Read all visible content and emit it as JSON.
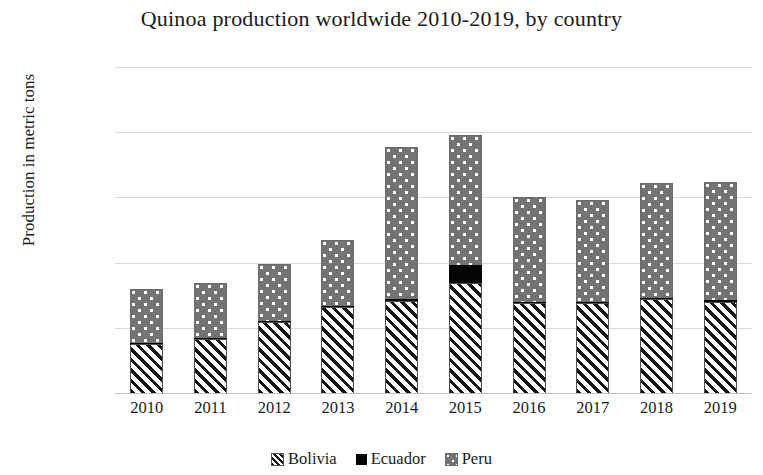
{
  "chart_data": {
    "type": "bar",
    "stacked": true,
    "title": "Quinoa production worldwide 2010-2019, by country",
    "xlabel": "",
    "ylabel": "Production in metric tons",
    "categories": [
      "2010",
      "2011",
      "2012",
      "2013",
      "2014",
      "2015",
      "2016",
      "2017",
      "2018",
      "2019"
    ],
    "ylim": [
      0,
      250000
    ],
    "yticks": [
      0,
      50000,
      100000,
      150000,
      200000,
      250000
    ],
    "ytick_labels": [
      "0",
      "50000",
      "100000",
      "150000",
      "200000",
      "250000"
    ],
    "grid": true,
    "legend_position": "bottom",
    "series": [
      {
        "name": "Bolivia",
        "pattern": "diagonal-hatch",
        "color": "#ffffff",
        "values": [
          37600,
          41400,
          54500,
          66000,
          70500,
          84400,
          69000,
          69000,
          72000,
          70000
        ]
      },
      {
        "name": "Ecuador",
        "pattern": "solid",
        "color": "#050505",
        "values": [
          800,
          900,
          900,
          1000,
          1500,
          13800,
          1000,
          900,
          900,
          1000
        ]
      },
      {
        "name": "Peru",
        "pattern": "dotted",
        "color": "#737373",
        "values": [
          41200,
          42100,
          43600,
          50400,
          117000,
          99600,
          80000,
          78100,
          88100,
          91000
        ]
      }
    ],
    "totals": [
      79600,
      84400,
      99000,
      117400,
      189000,
      197800,
      150000,
      148000,
      161000,
      162000
    ]
  },
  "legend": {
    "items": [
      {
        "label": "Bolivia",
        "swatch": "hatch-swatch-icon"
      },
      {
        "label": "Ecuador",
        "swatch": "solid-swatch-icon"
      },
      {
        "label": "Peru",
        "swatch": "dotted-swatch-icon"
      }
    ]
  }
}
